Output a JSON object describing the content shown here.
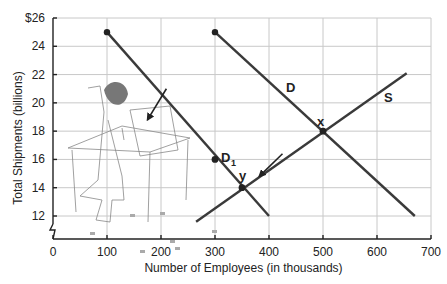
{
  "chart_data": {
    "type": "line",
    "title": "",
    "xlabel": "Number of Employees (in thousands)",
    "ylabel": "Total Shipments (billions)",
    "xlim": [
      0,
      700
    ],
    "ylim": [
      10,
      26
    ],
    "x_ticks": [
      0,
      100,
      200,
      300,
      400,
      500,
      600,
      700
    ],
    "x_tick_labels": [
      "0",
      "100",
      "200",
      "300",
      "400",
      "500",
      "600",
      "700"
    ],
    "y_ticks": [
      12,
      14,
      16,
      18,
      20,
      22,
      24,
      26
    ],
    "y_tick_labels": [
      "12",
      "14",
      "16",
      "18",
      "20",
      "22",
      "24",
      "$26"
    ],
    "grid": true,
    "axis_break": true,
    "series": [
      {
        "name": "D",
        "points": [
          [
            300,
            25
          ],
          [
            670,
            12
          ]
        ],
        "start_marker": true
      },
      {
        "name": "D1",
        "points": [
          [
            100,
            25
          ],
          [
            400,
            12
          ]
        ],
        "start_marker": true
      },
      {
        "name": "S",
        "points": [
          [
            265,
            11.6
          ],
          [
            655,
            22.1
          ]
        ]
      }
    ],
    "markers": [
      {
        "label": "x",
        "x": 500,
        "y": 18
      },
      {
        "label": "y",
        "x": 350,
        "y": 14
      },
      {
        "label": "D1",
        "x": 300,
        "y": 16
      }
    ],
    "annotations": [
      {
        "type": "arrow",
        "from": [
          210,
          21
        ],
        "to": [
          175,
          18.8
        ],
        "meaning": "demand shift left"
      },
      {
        "type": "arrow",
        "from": [
          425,
          16.4
        ],
        "to": [
          382,
          14.8
        ],
        "meaning": "movement along supply"
      },
      {
        "type": "illustration",
        "description": "Worker packing box at table"
      }
    ]
  },
  "labels": {
    "xlabel": "Number of Employees (in thousands)",
    "ylabel": "Total Shipments (billions)",
    "d_label": "D",
    "d1_label": "D",
    "d1_sub": "1",
    "s_label": "S",
    "x_label": "x",
    "y_label": "y"
  }
}
